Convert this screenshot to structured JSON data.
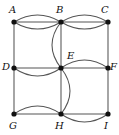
{
  "figure": {
    "kind": "multigraph-diagram",
    "width": 119,
    "height": 135,
    "background_color": "#ffffff",
    "edge_color": "#555555",
    "vertex_color": "#111111",
    "label_color": "#111111"
  },
  "vertices": [
    {
      "id": "A",
      "label": "A",
      "x": 14,
      "y": 22,
      "label_x": 9,
      "label_y": 5,
      "label_anchor": "above-left"
    },
    {
      "id": "B",
      "label": "B",
      "x": 61,
      "y": 22,
      "label_x": 56,
      "label_y": 5,
      "label_anchor": "above"
    },
    {
      "id": "C",
      "label": "C",
      "x": 108,
      "y": 22,
      "label_x": 101,
      "label_y": 5,
      "label_anchor": "above-right"
    },
    {
      "id": "D",
      "label": "D",
      "x": 14,
      "y": 68,
      "label_x": 2,
      "label_y": 62,
      "label_anchor": "left"
    },
    {
      "id": "E",
      "label": "E",
      "x": 61,
      "y": 68,
      "label_x": 67,
      "label_y": 51,
      "label_anchor": "above-right"
    },
    {
      "id": "F",
      "label": "F",
      "x": 108,
      "y": 68,
      "label_x": 110,
      "label_y": 62,
      "label_anchor": "right"
    },
    {
      "id": "G",
      "label": "G",
      "x": 14,
      "y": 114,
      "label_x": 9,
      "label_y": 121,
      "label_anchor": "below-left"
    },
    {
      "id": "H",
      "label": "H",
      "x": 61,
      "y": 114,
      "label_x": 55,
      "label_y": 121,
      "label_anchor": "below"
    },
    {
      "id": "I",
      "label": "I",
      "x": 108,
      "y": 114,
      "label_x": 104,
      "label_y": 121,
      "label_anchor": "below-right"
    }
  ],
  "edges": [
    {
      "from": "A",
      "to": "B",
      "shape": "straight",
      "multiplicity_index": 1
    },
    {
      "from": "A",
      "to": "B",
      "shape": "arc-up",
      "multiplicity_index": 2,
      "bulge": 7
    },
    {
      "from": "A",
      "to": "B",
      "shape": "arc-down",
      "multiplicity_index": 3,
      "bulge": 7
    },
    {
      "from": "B",
      "to": "C",
      "shape": "straight",
      "multiplicity_index": 1
    },
    {
      "from": "B",
      "to": "C",
      "shape": "arc-up",
      "multiplicity_index": 2,
      "bulge": 7
    },
    {
      "from": "B",
      "to": "C",
      "shape": "arc-down",
      "multiplicity_index": 3,
      "bulge": 7
    },
    {
      "from": "A",
      "to": "D",
      "shape": "straight",
      "multiplicity_index": 1
    },
    {
      "from": "C",
      "to": "F",
      "shape": "straight",
      "multiplicity_index": 1
    },
    {
      "from": "B",
      "to": "E",
      "shape": "straight",
      "multiplicity_index": 1
    },
    {
      "from": "B",
      "to": "E",
      "shape": "arc-left",
      "multiplicity_index": 2,
      "bulge": 9
    },
    {
      "from": "D",
      "to": "E",
      "shape": "straight",
      "multiplicity_index": 1
    },
    {
      "from": "D",
      "to": "E",
      "shape": "arc-down",
      "multiplicity_index": 2,
      "bulge": 8
    },
    {
      "from": "E",
      "to": "F",
      "shape": "straight",
      "multiplicity_index": 1
    },
    {
      "from": "E",
      "to": "F",
      "shape": "arc-up",
      "multiplicity_index": 2,
      "bulge": 8
    },
    {
      "from": "E",
      "to": "H",
      "shape": "straight",
      "multiplicity_index": 1
    },
    {
      "from": "E",
      "to": "H",
      "shape": "arc-right",
      "multiplicity_index": 2,
      "bulge": 9
    },
    {
      "from": "D",
      "to": "G",
      "shape": "straight",
      "multiplicity_index": 1
    },
    {
      "from": "F",
      "to": "I",
      "shape": "straight",
      "multiplicity_index": 1
    },
    {
      "from": "G",
      "to": "H",
      "shape": "straight",
      "multiplicity_index": 1
    },
    {
      "from": "G",
      "to": "H",
      "shape": "arc-up",
      "multiplicity_index": 2,
      "bulge": 8
    },
    {
      "from": "H",
      "to": "I",
      "shape": "straight",
      "multiplicity_index": 1
    },
    {
      "from": "H",
      "to": "I",
      "shape": "arc-down",
      "multiplicity_index": 2,
      "bulge": 8
    }
  ]
}
